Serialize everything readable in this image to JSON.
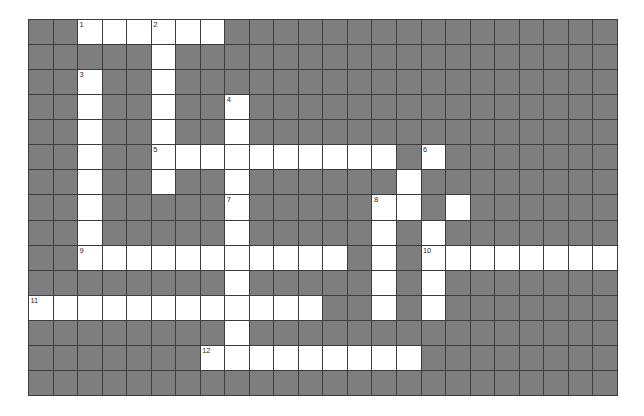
{
  "app": {
    "title": "Crossword Puzzle Grid",
    "background_color": "#ffffff",
    "block_color": "#7e7e7e",
    "open_color": "#ffffff",
    "border_color": "#3c3c3c",
    "number_color": "#2a2a2a"
  },
  "grid": {
    "columns": 24,
    "rows": 15,
    "cell_width": 24.54,
    "cell_height": 25.07,
    "origin_x": 28,
    "origin_y": 19,
    "legend": {
      "block": "#",
      "open": "."
    },
    "clue_numbers": [
      {
        "number": "1",
        "row": 0,
        "col": 2
      },
      {
        "number": "2",
        "row": 0,
        "col": 5
      },
      {
        "number": "3",
        "row": 2,
        "col": 2
      },
      {
        "number": "4",
        "row": 3,
        "col": 8
      },
      {
        "number": "5",
        "row": 5,
        "col": 5
      },
      {
        "number": "6",
        "row": 5,
        "col": 16
      },
      {
        "number": "7",
        "row": 7,
        "col": 8
      },
      {
        "number": "8",
        "row": 7,
        "col": 14
      },
      {
        "number": "9",
        "row": 9,
        "col": 2
      },
      {
        "number": "10",
        "row": 9,
        "col": 16
      },
      {
        "number": "11",
        "row": 11,
        "col": 0
      },
      {
        "number": "12",
        "row": 13,
        "col": 7
      }
    ],
    "cells": [
      "##......################",
      "#####.##################",
      "##.##.##################",
      "##.##.##.###############",
      "##.##.##.###############",
      "##.##..........#.#######",
      "##.##.##.######.########",
      "##.#####.#####..#.######",
      "##.#####.#####.#.#######",
      "##...........#.#........",
      "########.#####.#.#######",
      "............##.#.#######",
      "########.###############",
      "#######.........########",
      "########################"
    ]
  }
}
